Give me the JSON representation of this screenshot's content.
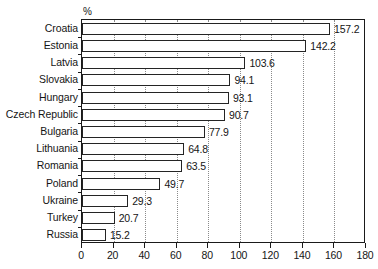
{
  "chart_data": {
    "type": "bar",
    "orientation": "horizontal",
    "title": "",
    "subtitle": "",
    "xlabel": "",
    "ylabel": "",
    "unit_label": "%",
    "categories": [
      "Croatia",
      "Estonia",
      "Latvia",
      "Slovakia",
      "Hungary",
      "Czech Republic",
      "Bulgaria",
      "Lithuania",
      "Romania",
      "Poland",
      "Ukraine",
      "Turkey",
      "Russia"
    ],
    "values": [
      157.2,
      142.2,
      103.6,
      94.1,
      93.1,
      90.7,
      77.9,
      64.8,
      63.5,
      49.7,
      29.3,
      20.7,
      15.2
    ],
    "value_labels": [
      "157.2",
      "142.2",
      "103.6",
      "94.1",
      "93.1",
      "90.7",
      "77.9",
      "64.8",
      "63.5",
      "49.7",
      "29.3",
      "20.7",
      "15.2"
    ],
    "xlim": [
      0,
      180
    ],
    "xticks": [
      0,
      20,
      40,
      60,
      80,
      100,
      120,
      140,
      160,
      180
    ],
    "xtick_labels": [
      "0",
      "20",
      "40",
      "60",
      "80",
      "100",
      "120",
      "140",
      "160",
      "180"
    ],
    "grid": true,
    "grid_axis": "x",
    "grid_style": "dotted",
    "legend": false,
    "legend_entries": [],
    "bar_fill_color": "#ffffff",
    "bar_edge_color": "#242424",
    "axis_color": "#1a1a1a",
    "gridline_color": "#8a8a8a",
    "text_color": "#151515",
    "background_color": "#ffffff"
  }
}
